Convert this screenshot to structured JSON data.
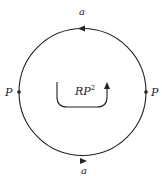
{
  "diagram": {
    "center_label": "RP",
    "center_label_sup": "2",
    "edge_labels": {
      "top": "a",
      "bottom": "a"
    },
    "point_labels": {
      "left": "P",
      "right": "P"
    },
    "colors": {
      "stroke": "#222222",
      "background": "#ffffff"
    },
    "arrows": {
      "top_edge_direction": "left",
      "bottom_edge_direction": "right",
      "orientation_arrow": "counterclockwise-u-turn-up"
    }
  }
}
